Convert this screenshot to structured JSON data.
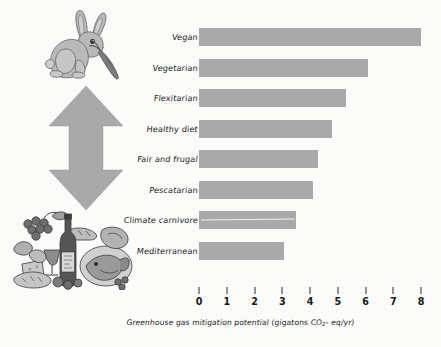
{
  "chart_data": {
    "type": "bar",
    "orientation": "horizontal",
    "title": "",
    "xlabel": "Greenhouse gas mitigation potential (gigatons CO2-eq/yr)",
    "ylabel": "",
    "xlim": [
      0,
      8
    ],
    "grid": false,
    "legend": null,
    "bar_color": "#a9a9a9",
    "categories": [
      "Vegan",
      "Vegetarian",
      "Flexitarian",
      "Healthy diet",
      "Fair and frugal",
      "Pescatarian",
      "Climate carnivore",
      "Mediterranean"
    ],
    "values": [
      8.0,
      6.1,
      5.3,
      4.8,
      4.3,
      4.1,
      3.5,
      3.05
    ],
    "xticks": [
      "0",
      "1",
      "2",
      "3",
      "4",
      "5",
      "6",
      "7",
      "8"
    ],
    "xtick_values": [
      0,
      1,
      2,
      3,
      4,
      5,
      6,
      7,
      8
    ]
  },
  "axis": {
    "caption_prefix": "Greenhouse gas mitigation potential (gigatons CO",
    "caption_sub": "2",
    "caption_suffix": "- eq/yr)"
  },
  "illustrations": {
    "top": {
      "name": "rabbit-eating-carrot",
      "alt": "Rabbit eating a carrot"
    },
    "arrow": {
      "name": "double-headed-vertical-arrow",
      "alt": "Double headed vertical arrow"
    },
    "bottom": {
      "name": "mediterranean-food-spread",
      "alt": "Mediterranean food spread with wine bottle, fish, bread, vegetables and grapes"
    }
  }
}
